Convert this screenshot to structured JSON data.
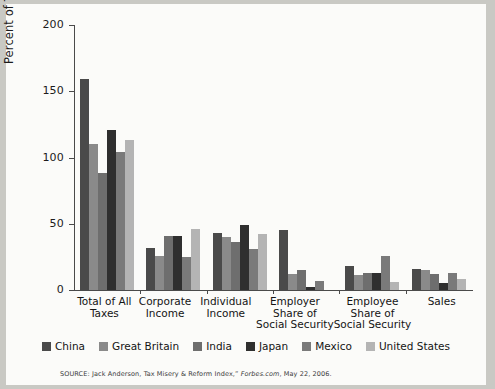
{
  "chart_data": {
    "type": "bar",
    "title": "",
    "xlabel": "",
    "ylabel": "Percent of Tax Burden",
    "ylim": [
      0,
      200
    ],
    "yticks": [
      0,
      50,
      100,
      150,
      200
    ],
    "grid": false,
    "legend_position": "bottom",
    "categories": [
      "Total of All Taxes",
      "Corporate Income",
      "Individual Income",
      "Employer Share of Social Security",
      "Employee Share of Social Security",
      "Sales"
    ],
    "category_lines": [
      [
        "Total of All",
        "Taxes"
      ],
      [
        "Corporate",
        "Income"
      ],
      [
        "Individual",
        "Income"
      ],
      [
        "Employer",
        "Share of",
        "Social Security"
      ],
      [
        "Employee",
        "Share of",
        "Social Security"
      ],
      [
        "Sales"
      ]
    ],
    "series": [
      {
        "name": "China",
        "color": "#4a4a4a",
        "values": [
          159,
          32,
          43,
          45,
          18,
          16
        ]
      },
      {
        "name": "Great Britain",
        "color": "#8a8a8a",
        "values": [
          110,
          26,
          40,
          12,
          11,
          15
        ]
      },
      {
        "name": "India",
        "color": "#6e6e6e",
        "values": [
          88,
          41,
          36,
          15,
          13,
          12
        ]
      },
      {
        "name": "Japan",
        "color": "#2f2f2f",
        "values": [
          121,
          41,
          49,
          2,
          13,
          5
        ]
      },
      {
        "name": "Mexico",
        "color": "#7a7a7a",
        "values": [
          104,
          25,
          31,
          7,
          26,
          13
        ]
      },
      {
        "name": "United States",
        "color": "#b4b4b4",
        "values": [
          113,
          46,
          42,
          0,
          6,
          8
        ]
      }
    ]
  },
  "axis": {
    "y_label": "Percent of Tax Burden",
    "y_tick_labels": [
      "200",
      "150",
      "100",
      "50",
      "0"
    ]
  },
  "legend": {
    "items": [
      {
        "label": "China"
      },
      {
        "label": "Great Britain"
      },
      {
        "label": "India"
      },
      {
        "label": "Japan"
      },
      {
        "label": "Mexico"
      },
      {
        "label": "United States"
      }
    ]
  },
  "source": {
    "prefix": "SOURCE: Jack Anderson, Tax Misery & Reform Index,” ",
    "publication": "Forbes.com",
    "suffix": ", May 22, 2006."
  }
}
